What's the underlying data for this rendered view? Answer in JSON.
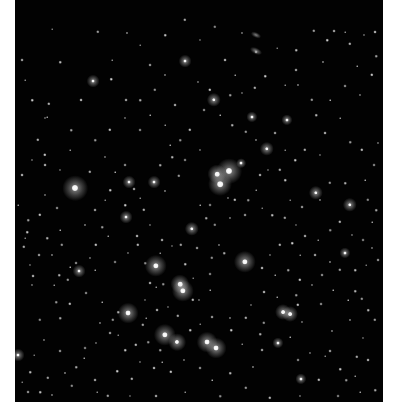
{
  "image": {
    "subject": "open star cluster star field",
    "background_color": "#020202",
    "border_color": "#ffffff",
    "sky_rect": {
      "x": 15,
      "y": 0,
      "w": 368,
      "h": 402
    }
  },
  "bright_stars": [
    {
      "x": 75,
      "y": 188,
      "r": 16
    },
    {
      "x": 229,
      "y": 171,
      "r": 16
    },
    {
      "x": 217,
      "y": 174,
      "r": 12
    },
    {
      "x": 220,
      "y": 184,
      "r": 15
    },
    {
      "x": 156,
      "y": 266,
      "r": 14
    },
    {
      "x": 180,
      "y": 284,
      "r": 12
    },
    {
      "x": 183,
      "y": 291,
      "r": 14
    },
    {
      "x": 245,
      "y": 262,
      "r": 14
    },
    {
      "x": 128,
      "y": 313,
      "r": 13
    },
    {
      "x": 165,
      "y": 335,
      "r": 14
    },
    {
      "x": 177,
      "y": 342,
      "r": 11
    },
    {
      "x": 207,
      "y": 342,
      "r": 13
    },
    {
      "x": 216,
      "y": 348,
      "r": 13
    },
    {
      "x": 283,
      "y": 312,
      "r": 10
    },
    {
      "x": 290,
      "y": 314,
      "r": 10
    },
    {
      "x": 267,
      "y": 149,
      "r": 9
    },
    {
      "x": 214,
      "y": 100,
      "r": 9
    },
    {
      "x": 185,
      "y": 61,
      "r": 8
    },
    {
      "x": 316,
      "y": 193,
      "r": 9
    },
    {
      "x": 350,
      "y": 205,
      "r": 9
    },
    {
      "x": 192,
      "y": 229,
      "r": 9
    },
    {
      "x": 93,
      "y": 81,
      "r": 8
    },
    {
      "x": 129,
      "y": 182,
      "r": 8
    },
    {
      "x": 154,
      "y": 182,
      "r": 8
    },
    {
      "x": 126,
      "y": 217,
      "r": 8
    },
    {
      "x": 79,
      "y": 271,
      "r": 8
    },
    {
      "x": 345,
      "y": 253,
      "r": 7
    },
    {
      "x": 287,
      "y": 120,
      "r": 7
    },
    {
      "x": 252,
      "y": 117,
      "r": 7
    },
    {
      "x": 241,
      "y": 163,
      "r": 6
    },
    {
      "x": 278,
      "y": 343,
      "r": 7
    },
    {
      "x": 301,
      "y": 379,
      "r": 7
    },
    {
      "x": 18,
      "y": 355,
      "r": 8
    }
  ],
  "faint_stars": [
    [
      52,
      29
    ],
    [
      60,
      62
    ],
    [
      98,
      32
    ],
    [
      127,
      33
    ],
    [
      126,
      100
    ],
    [
      112,
      60
    ],
    [
      111,
      79
    ],
    [
      49,
      104
    ],
    [
      45,
      118
    ],
    [
      81,
      100
    ],
    [
      47,
      117
    ],
    [
      71,
      130
    ],
    [
      45,
      155
    ],
    [
      105,
      157
    ],
    [
      125,
      165
    ],
    [
      115,
      172
    ],
    [
      172,
      157
    ],
    [
      179,
      176
    ],
    [
      165,
      191
    ],
    [
      134,
      189
    ],
    [
      140,
      198
    ],
    [
      125,
      205
    ],
    [
      144,
      210
    ],
    [
      150,
      225
    ],
    [
      137,
      236
    ],
    [
      108,
      236
    ],
    [
      102,
      227
    ],
    [
      96,
      245
    ],
    [
      90,
      258
    ],
    [
      76,
      263
    ],
    [
      70,
      267
    ],
    [
      59,
      275
    ],
    [
      68,
      280
    ],
    [
      52,
      255
    ],
    [
      39,
      255
    ],
    [
      25,
      238
    ],
    [
      27,
      232
    ],
    [
      24,
      247
    ],
    [
      30,
      265
    ],
    [
      33,
      276
    ],
    [
      54,
      285
    ],
    [
      56,
      302
    ],
    [
      70,
      304
    ],
    [
      32,
      285
    ],
    [
      86,
      293
    ],
    [
      102,
      302
    ],
    [
      118,
      312
    ],
    [
      113,
      320
    ],
    [
      100,
      323
    ],
    [
      110,
      333
    ],
    [
      118,
      335
    ],
    [
      125,
      350
    ],
    [
      143,
      325
    ],
    [
      145,
      300
    ],
    [
      150,
      283
    ],
    [
      156,
      287
    ],
    [
      163,
      284
    ],
    [
      193,
      300
    ],
    [
      199,
      300
    ],
    [
      210,
      274
    ],
    [
      210,
      290
    ],
    [
      224,
      253
    ],
    [
      212,
      258
    ],
    [
      219,
      245
    ],
    [
      197,
      248
    ],
    [
      193,
      278
    ],
    [
      185,
      264
    ],
    [
      181,
      245
    ],
    [
      172,
      246
    ],
    [
      162,
      240
    ],
    [
      160,
      253
    ],
    [
      145,
      263
    ],
    [
      138,
      245
    ],
    [
      128,
      253
    ],
    [
      115,
      262
    ],
    [
      95,
      270
    ],
    [
      60,
      318
    ],
    [
      40,
      320
    ],
    [
      44,
      340
    ],
    [
      60,
      351
    ],
    [
      34,
      355
    ],
    [
      30,
      372
    ],
    [
      48,
      378
    ],
    [
      65,
      373
    ],
    [
      95,
      380
    ],
    [
      97,
      392
    ],
    [
      117,
      371
    ],
    [
      132,
      379
    ],
    [
      140,
      362
    ],
    [
      154,
      368
    ],
    [
      162,
      362
    ],
    [
      160,
      350
    ],
    [
      171,
      372
    ],
    [
      184,
      360
    ],
    [
      200,
      368
    ],
    [
      212,
      380
    ],
    [
      230,
      373
    ],
    [
      246,
      388
    ],
    [
      253,
      367
    ],
    [
      262,
      350
    ],
    [
      242,
      344
    ],
    [
      231,
      330
    ],
    [
      246,
      318
    ],
    [
      251,
      305
    ],
    [
      264,
      292
    ],
    [
      277,
      297
    ],
    [
      296,
      295
    ],
    [
      298,
      305
    ],
    [
      302,
      322
    ],
    [
      321,
      304
    ],
    [
      333,
      290
    ],
    [
      355,
      291
    ],
    [
      362,
      299
    ],
    [
      332,
      331
    ],
    [
      330,
      351
    ],
    [
      325,
      356
    ],
    [
      340,
      369
    ],
    [
      357,
      357
    ],
    [
      363,
      338
    ],
    [
      368,
      360
    ],
    [
      355,
      376
    ],
    [
      346,
      380
    ],
    [
      319,
      380
    ],
    [
      310,
      353
    ],
    [
      298,
      360
    ],
    [
      290,
      337
    ],
    [
      260,
      334
    ],
    [
      264,
      323
    ],
    [
      230,
      318
    ],
    [
      212,
      317
    ],
    [
      200,
      324
    ],
    [
      190,
      330
    ],
    [
      178,
      316
    ],
    [
      168,
      307
    ],
    [
      157,
      310
    ],
    [
      146,
      318
    ],
    [
      148,
      342
    ],
    [
      136,
      345
    ],
    [
      96,
      343
    ],
    [
      85,
      348
    ],
    [
      84,
      358
    ],
    [
      76,
      367
    ],
    [
      72,
      386
    ],
    [
      52,
      395
    ],
    [
      28,
      392
    ],
    [
      22,
      382
    ],
    [
      40,
      392
    ],
    [
      108,
      396
    ],
    [
      130,
      396
    ],
    [
      156,
      396
    ],
    [
      185,
      392
    ],
    [
      220,
      396
    ],
    [
      270,
      398
    ],
    [
      300,
      396
    ],
    [
      338,
      396
    ],
    [
      360,
      392
    ],
    [
      375,
      390
    ],
    [
      215,
      27
    ],
    [
      242,
      33
    ],
    [
      256,
      52
    ],
    [
      277,
      48
    ],
    [
      296,
      50
    ],
    [
      314,
      31
    ],
    [
      323,
      62
    ],
    [
      334,
      31
    ],
    [
      345,
      32
    ],
    [
      327,
      40
    ],
    [
      350,
      44
    ],
    [
      364,
      35
    ],
    [
      375,
      32
    ],
    [
      357,
      66
    ],
    [
      376,
      56
    ],
    [
      372,
      75
    ],
    [
      360,
      95
    ],
    [
      345,
      86
    ],
    [
      330,
      100
    ],
    [
      316,
      115
    ],
    [
      312,
      100
    ],
    [
      298,
      85
    ],
    [
      296,
      70
    ],
    [
      285,
      85
    ],
    [
      265,
      76
    ],
    [
      255,
      88
    ],
    [
      242,
      93
    ],
    [
      225,
      60
    ],
    [
      235,
      75
    ],
    [
      230,
      95
    ],
    [
      210,
      90
    ],
    [
      198,
      82
    ],
    [
      204,
      110
    ],
    [
      220,
      115
    ],
    [
      232,
      125
    ],
    [
      246,
      132
    ],
    [
      256,
      140
    ],
    [
      275,
      133
    ],
    [
      285,
      150
    ],
    [
      295,
      160
    ],
    [
      305,
      150
    ],
    [
      320,
      155
    ],
    [
      325,
      133
    ],
    [
      340,
      118
    ],
    [
      350,
      142
    ],
    [
      362,
      150
    ],
    [
      378,
      143
    ],
    [
      374,
      165
    ],
    [
      365,
      180
    ],
    [
      345,
      183
    ],
    [
      330,
      183
    ],
    [
      320,
      200
    ],
    [
      302,
      207
    ],
    [
      290,
      200
    ],
    [
      285,
      180
    ],
    [
      280,
      170
    ],
    [
      268,
      170
    ],
    [
      260,
      175
    ],
    [
      256,
      190
    ],
    [
      248,
      200
    ],
    [
      235,
      200
    ],
    [
      228,
      198
    ],
    [
      210,
      205
    ],
    [
      200,
      205
    ],
    [
      206,
      218
    ],
    [
      215,
      225
    ],
    [
      230,
      218
    ],
    [
      245,
      215
    ],
    [
      262,
      208
    ],
    [
      272,
      215
    ],
    [
      285,
      218
    ],
    [
      296,
      225
    ],
    [
      305,
      236
    ],
    [
      318,
      240
    ],
    [
      330,
      230
    ],
    [
      340,
      222
    ],
    [
      352,
      235
    ],
    [
      363,
      240
    ],
    [
      372,
      222
    ],
    [
      376,
      210
    ],
    [
      368,
      200
    ],
    [
      372,
      248
    ],
    [
      378,
      260
    ],
    [
      366,
      265
    ],
    [
      355,
      270
    ],
    [
      340,
      270
    ],
    [
      330,
      262
    ],
    [
      315,
      255
    ],
    [
      300,
      255
    ],
    [
      292,
      243
    ],
    [
      280,
      245
    ],
    [
      270,
      255
    ],
    [
      262,
      268
    ],
    [
      275,
      275
    ],
    [
      288,
      270
    ],
    [
      300,
      280
    ],
    [
      312,
      285
    ],
    [
      322,
      275
    ],
    [
      348,
      300
    ],
    [
      368,
      310
    ],
    [
      375,
      320
    ],
    [
      350,
      320
    ],
    [
      22,
      60
    ],
    [
      25,
      80
    ],
    [
      32,
      100
    ],
    [
      38,
      140
    ],
    [
      32,
      160
    ],
    [
      22,
      175
    ],
    [
      18,
      205
    ],
    [
      28,
      220
    ],
    [
      40,
      215
    ],
    [
      45,
      195
    ],
    [
      57,
      208
    ],
    [
      60,
      230
    ],
    [
      47,
      238
    ],
    [
      62,
      245
    ],
    [
      85,
      225
    ],
    [
      95,
      210
    ],
    [
      105,
      200
    ],
    [
      110,
      190
    ],
    [
      90,
      172
    ],
    [
      60,
      170
    ],
    [
      45,
      165
    ],
    [
      70,
      150
    ],
    [
      95,
      140
    ],
    [
      110,
      130
    ],
    [
      125,
      118
    ],
    [
      140,
      130
    ],
    [
      150,
      115
    ],
    [
      140,
      100
    ],
    [
      155,
      90
    ],
    [
      165,
      75
    ],
    [
      150,
      65
    ],
    [
      140,
      45
    ],
    [
      165,
      35
    ],
    [
      185,
      20
    ],
    [
      200,
      40
    ],
    [
      175,
      105
    ],
    [
      165,
      125
    ],
    [
      180,
      140
    ],
    [
      190,
      130
    ],
    [
      200,
      150
    ],
    [
      185,
      160
    ],
    [
      170,
      145
    ],
    [
      160,
      165
    ]
  ],
  "galaxies": [
    {
      "x": 256,
      "y": 35,
      "w": 10,
      "h": 5
    },
    {
      "x": 256,
      "y": 51,
      "w": 12,
      "h": 6
    }
  ]
}
